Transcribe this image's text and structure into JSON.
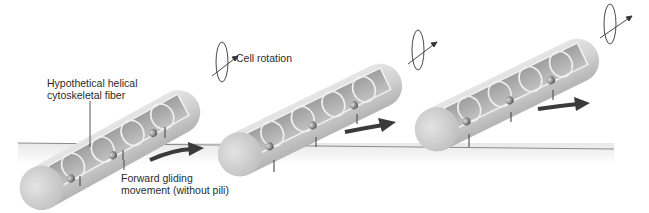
{
  "figure": {
    "labels": {
      "fiber_line1": "Hypothetical helical",
      "fiber_line2": "cytoskeletal fiber",
      "glide_line1": "Forward gliding",
      "glide_line2": "movement (without pili)",
      "rotation": "Cell rotation"
    },
    "cells": [
      {
        "position": "left",
        "helix_coils": 4,
        "anchors": 3
      },
      {
        "position": "middle",
        "helix_coils": 4,
        "anchors": 3
      },
      {
        "position": "right",
        "helix_coils": 4,
        "anchors": 3
      }
    ],
    "colors": {
      "cell_body": "#d4d4d4",
      "cell_shadow": "#b8b8b8",
      "cell_interior": "#a9a9a9",
      "helix": "#eeeeee",
      "arrow": "#3a3a3a",
      "ground_line": "#8a8a8a",
      "text": "#2b2b2b"
    }
  }
}
